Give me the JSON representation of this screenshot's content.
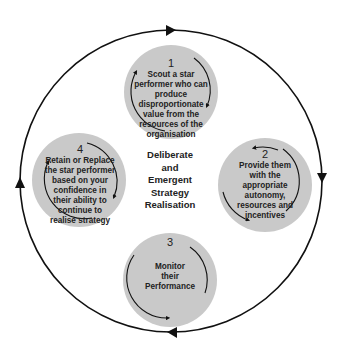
{
  "diagram": {
    "type": "cycle",
    "center_label": [
      "Deliberate",
      "and",
      "Emergent",
      "Strategy",
      "Realisation"
    ],
    "outer_cycle_direction": "clockwise",
    "colors": {
      "node_fill": "#c9c9c9",
      "line": "#111111",
      "text": "#222222"
    },
    "nodes": [
      {
        "number": "1",
        "lines": [
          "Scout a star",
          "performer who can",
          "produce",
          "disproportionate",
          "value from the",
          "resources of the",
          "organisation"
        ]
      },
      {
        "number": "2",
        "lines": [
          "Provide them",
          "with the",
          "appropriate",
          "autonomy,",
          "resources and",
          "incentives"
        ]
      },
      {
        "number": "3",
        "lines": [
          "Monitor",
          "their",
          "Performance"
        ]
      },
      {
        "number": "4",
        "lines": [
          "Retain or Replace",
          "the star performer",
          "based on your",
          "confidence in",
          "their ability to",
          "continue to",
          "realise strategy"
        ]
      }
    ]
  }
}
